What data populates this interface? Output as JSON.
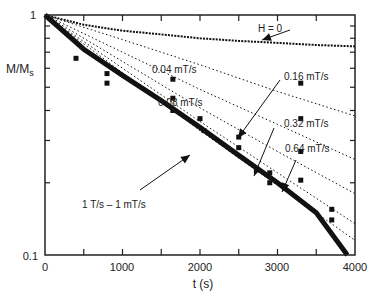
{
  "chart_data": {
    "type": "line",
    "title": "",
    "xlabel": "t (s)",
    "ylabel": "M/M_s",
    "ylabel_main": "M/M",
    "ylabel_sub": "s",
    "yscale": "log",
    "xlim": [
      0,
      4000
    ],
    "ylim": [
      0.1,
      1
    ],
    "x_ticks": [
      "0",
      "1000",
      "2000",
      "3000",
      "4000"
    ],
    "y_ticks": [
      "0.1",
      "1"
    ],
    "grid": false,
    "annotations": [
      {
        "text": "H = 0",
        "x": 3300,
        "y": 0.9
      },
      {
        "text": "0.04 mT/s",
        "x": 2050,
        "y": 0.57
      },
      {
        "text": "0.08 mT/s",
        "x": 2200,
        "y": 0.43
      },
      {
        "text": "0.16 mT/s",
        "x": 3100,
        "y": 0.52
      },
      {
        "text": "0.32 mT/s",
        "x": 3100,
        "y": 0.38
      },
      {
        "text": "0.64 mT/s",
        "x": 3400,
        "y": 0.29
      },
      {
        "text": "1 T/s – 1 mT/s",
        "x": 900,
        "y": 0.155
      }
    ],
    "series": [
      {
        "name": "H = 0",
        "style": "dotted-solid",
        "x": [
          0,
          500,
          1000,
          1500,
          2000,
          2500,
          3000,
          3500,
          4000
        ],
        "y": [
          1.0,
          0.91,
          0.86,
          0.83,
          0.8,
          0.78,
          0.765,
          0.75,
          0.74
        ]
      },
      {
        "name": "0.04 mT/s",
        "style": "dotted",
        "x": [
          0,
          1000,
          2000,
          3000,
          4000
        ],
        "y": [
          1.0,
          0.79,
          0.62,
          0.48,
          0.38
        ]
      },
      {
        "name": "0.08 mT/s",
        "style": "dotted",
        "x": [
          0,
          1000,
          2000,
          3000,
          4000
        ],
        "y": [
          1.0,
          0.7,
          0.49,
          0.35,
          0.25
        ]
      },
      {
        "name": "0.16 mT/s",
        "style": "dotted",
        "x": [
          0,
          1000,
          2000,
          3000,
          4000
        ],
        "y": [
          1.0,
          0.64,
          0.41,
          0.27,
          0.18
        ]
      },
      {
        "name": "0.32 mT/s",
        "style": "dotted",
        "x": [
          0,
          1000,
          2000,
          3000,
          4000
        ],
        "y": [
          1.0,
          0.6,
          0.36,
          0.22,
          0.135
        ]
      },
      {
        "name": "0.64 mT/s",
        "style": "dotted",
        "x": [
          0,
          1000,
          2000,
          3000,
          4000
        ],
        "y": [
          1.0,
          0.575,
          0.33,
          0.195,
          0.115
        ]
      },
      {
        "name": "1 T/s – 1 mT/s",
        "style": "thick",
        "x": [
          0,
          500,
          1000,
          1500,
          2000,
          2500,
          3000,
          3500,
          3900
        ],
        "y": [
          1.0,
          0.72,
          0.56,
          0.44,
          0.34,
          0.26,
          0.2,
          0.15,
          0.1
        ]
      },
      {
        "name": "markers",
        "style": "squares",
        "x": [
          400,
          800,
          800,
          1650,
          1650,
          1650,
          2000,
          2050,
          2500,
          2500,
          2900,
          2900,
          3300,
          3300,
          3300,
          3300,
          3700,
          3700
        ],
        "y": [
          0.66,
          0.57,
          0.52,
          0.54,
          0.45,
          0.4,
          0.37,
          0.33,
          0.31,
          0.28,
          0.22,
          0.2,
          0.52,
          0.37,
          0.27,
          0.205,
          0.155,
          0.14
        ]
      }
    ]
  }
}
